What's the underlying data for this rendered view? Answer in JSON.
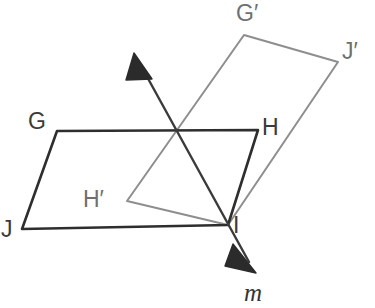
{
  "figure": {
    "colors": {
      "preimage_stroke": "#2e2e2e",
      "image_stroke": "#8e8e8e",
      "line_stroke": "#3b3b3b",
      "label_color": "#3a3a3a",
      "primed_label_color": "#6f6f6f",
      "background": "#ffffff"
    },
    "labels": {
      "G": "G",
      "H": "H",
      "I": "I",
      "J": "J",
      "G_prime": "G′",
      "H_prime": "H′",
      "J_prime": "J′",
      "line_m": "m"
    },
    "points": {
      "G": [
        57,
        131
      ],
      "H": [
        258,
        130
      ],
      "I": [
        228,
        225
      ],
      "J": [
        22,
        229
      ],
      "G_prime": [
        244,
        35
      ],
      "H_prime": [
        127,
        201
      ],
      "I_prime": [
        228,
        225
      ],
      "J_prime": [
        338,
        62
      ]
    },
    "label_positions": {
      "G": [
        28,
        110
      ],
      "H": [
        262,
        116
      ],
      "I": [
        233,
        214
      ],
      "J": [
        1,
        218
      ],
      "G_prime": [
        236,
        2
      ],
      "H_prime": [
        83,
        188
      ],
      "J_prime": [
        342,
        40
      ],
      "line_m": [
        244,
        280
      ]
    },
    "shapes": [
      {
        "name": "preimage-parallelogram-GHIJ",
        "vertices": [
          "G",
          "H",
          "I",
          "J"
        ],
        "stroke": "#2e2e2e",
        "style": "solid-dark"
      },
      {
        "name": "image-parallelogram-G-prime-H-prime-I-J-prime",
        "vertices": [
          "G_prime",
          "J_prime",
          "I",
          "H_prime"
        ],
        "stroke": "#8e8e8e",
        "style": "solid-gray"
      }
    ],
    "line_of_reflection": {
      "name": "m",
      "label": "m",
      "arrow_tip_upper": [
        134,
        53
      ],
      "arrow_tip_lower": [
        256,
        273
      ],
      "passes_through": [
        [
          172,
          130
        ],
        [
          228,
          225
        ]
      ],
      "double_headed": true
    }
  }
}
